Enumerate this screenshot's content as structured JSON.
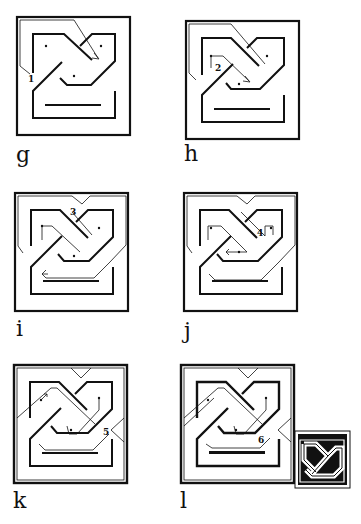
{
  "figure": {
    "ink_color": "#111111",
    "paper_color": "#ffffff",
    "panels": [
      {
        "id": "g",
        "label": "g",
        "step": "1",
        "note": "trace outer band diagonally into frame"
      },
      {
        "id": "h",
        "label": "h",
        "step": "2",
        "note": "second band strand drawn diagonally"
      },
      {
        "id": "i",
        "label": "i",
        "step": "3",
        "note": "band crosses over at top"
      },
      {
        "id": "j",
        "label": "j",
        "step": "4",
        "note": "band loops right and returns"
      },
      {
        "id": "k",
        "label": "k",
        "step": "5",
        "note": "band crosses at right side"
      },
      {
        "id": "l",
        "label": "l",
        "step": "6",
        "note": "completed interlace"
      }
    ],
    "finished_knot": {
      "label": "finished knot (inked)"
    }
  }
}
